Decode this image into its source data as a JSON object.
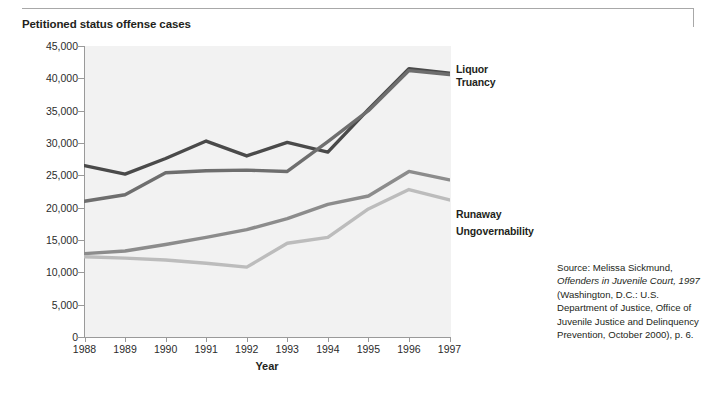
{
  "figure": {
    "title": "Petitioned status offense cases",
    "xaxis_title": "Year"
  },
  "source": {
    "prefix": "Source: Melissa Sickmund, ",
    "italic": "Offenders in Juvenile Court, 1997",
    "suffix": " (Washington, D.C.: U.S. Department of Justice, Office of Juvenile Justice and Delinquency Prevention, October 2000), p. 6."
  },
  "chart_data": {
    "type": "line",
    "title": "Petitioned status offense cases",
    "xlabel": "Year",
    "ylabel": "",
    "categories": [
      1988,
      1989,
      1990,
      1991,
      1992,
      1993,
      1994,
      1995,
      1996,
      1997
    ],
    "tick_labels_x": [
      "1988",
      "1989",
      "1990",
      "1991",
      "1992",
      "1993",
      "1994",
      "1995",
      "1996",
      "1997"
    ],
    "tick_labels_y": [
      "0",
      "5,000",
      "10,000",
      "15,000",
      "20,000",
      "25,000",
      "30,000",
      "35,000",
      "40,000",
      "45,000"
    ],
    "ylim": [
      0,
      45000
    ],
    "ytick_step": 5000,
    "xlim": [
      1988,
      1997
    ],
    "grid": false,
    "legend_position": "right-inline",
    "series": [
      {
        "name": "Liquor",
        "color": "#4a4a4a",
        "label_x": 1997,
        "label_y": 41000,
        "values": [
          26500,
          25200,
          27600,
          30300,
          28000,
          30100,
          28600,
          35200,
          41500,
          40800
        ]
      },
      {
        "name": "Truancy",
        "color": "#6e6e6e",
        "label_x": 1997,
        "label_y": 38800,
        "values": [
          21000,
          22000,
          25400,
          25700,
          25800,
          25600,
          30200,
          35000,
          41200,
          40600
        ]
      },
      {
        "name": "Runaway",
        "color": "#8c8c8c",
        "label_x": 1997,
        "label_y": 24500,
        "values": [
          12900,
          13300,
          14300,
          15400,
          16600,
          18300,
          20500,
          21800,
          25600,
          24300
        ]
      },
      {
        "name": "Ungovernability",
        "color": "#bcbcbc",
        "label_x": 1997,
        "label_y": 21300,
        "values": [
          12400,
          12200,
          11900,
          11400,
          10800,
          14500,
          15400,
          19800,
          22800,
          21200
        ]
      }
    ]
  }
}
